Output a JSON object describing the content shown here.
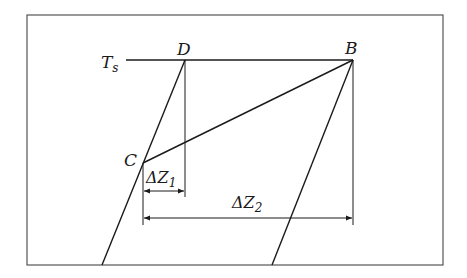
{
  "diagram": {
    "labels": {
      "ts": "T",
      "ts_sub": "s",
      "d": "D",
      "b": "B",
      "c": "C",
      "dz1": "ΔZ",
      "dz1_sub": "1",
      "dz2": "ΔZ",
      "dz2_sub": "2"
    },
    "colors": {
      "line": "#1a1a1a",
      "frame": "#555555",
      "background": "#ffffff"
    }
  }
}
